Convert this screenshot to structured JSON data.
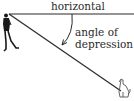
{
  "diagram": {
    "title": "Angle of depression",
    "labels": {
      "horizontal": "horizontal",
      "angle_line1": "angle of",
      "angle_line2": "depression"
    },
    "figures": {
      "observer": "person-icon",
      "target": "dog-icon"
    },
    "colors": {
      "line": "#2a2a2a",
      "figure": "#1a1a1a",
      "background": "#ffffff"
    }
  }
}
